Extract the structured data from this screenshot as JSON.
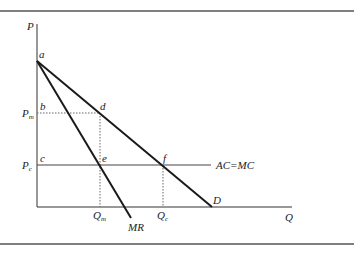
{
  "diagram": {
    "type": "monopoly-vs-competition",
    "axes": {
      "y_label": "P",
      "x_label": "Q"
    },
    "points": {
      "a": "a",
      "b": "b",
      "c": "c",
      "d": "d",
      "e": "e",
      "f": "f"
    },
    "price_labels": {
      "pm": "P",
      "pm_sub": "m",
      "pc": "P",
      "pc_sub": "c"
    },
    "quantity_labels": {
      "qm": "Q",
      "qm_sub": "m",
      "qc": "Q",
      "qc_sub": "c"
    },
    "curves": {
      "demand": "D",
      "marginal_revenue": "MR",
      "cost": "AC=MC"
    },
    "colors": {
      "line": "#1a1a1a",
      "axis": "#333333",
      "border": "#555555",
      "dotted": "#666666"
    }
  }
}
